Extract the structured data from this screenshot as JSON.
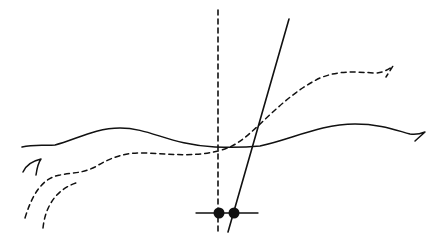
{
  "diagram": {
    "type": "hand-drawn sketch",
    "background": "#ffffff",
    "ink_color": "#111111",
    "elements": {
      "vertical_dashed_line": {
        "style": "dashed",
        "x": 218,
        "y1": 10,
        "y2": 232
      },
      "slanted_solid_line": {
        "style": "solid",
        "from": [
          289,
          19
        ],
        "to": [
          228,
          232
        ]
      },
      "baseline_segment": {
        "style": "solid",
        "y": 213,
        "x1": 196,
        "x2": 258
      },
      "points": [
        {
          "name": "left-dot",
          "cx": 219,
          "cy": 213,
          "r": 5.5
        },
        {
          "name": "right-dot",
          "cx": 234,
          "cy": 213,
          "r": 5.5
        }
      ],
      "solid_wavy_curve": {
        "style": "solid",
        "description": "wavy horizontal curve with hook at right end"
      },
      "dashed_curve_main": {
        "style": "dashed",
        "description": "rising S-curve from lower-left to upper-right with hook"
      },
      "dashed_curve_secondary": {
        "style": "dashed",
        "description": "short curved dashed arc lower-left"
      },
      "left_hook": {
        "style": "solid",
        "description": "small curved hook at left"
      }
    }
  }
}
